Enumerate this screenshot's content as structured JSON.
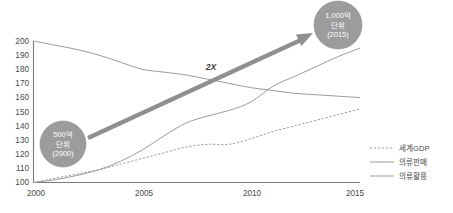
{
  "chart_data": {
    "type": "line",
    "title": "",
    "subtitle": "",
    "xlabel": "",
    "ylabel": "",
    "xlim": [
      2000,
      2015
    ],
    "ylim": [
      100,
      200
    ],
    "grid": false,
    "legend_position": "right",
    "x_ticks": [
      "2000",
      "2005",
      "2010",
      "2015"
    ],
    "y_ticks": [
      "200",
      "190",
      "180",
      "170",
      "160",
      "150",
      "140",
      "130",
      "120",
      "110",
      "100"
    ],
    "x": [
      2000,
      2001,
      2002,
      2003,
      2004,
      2005,
      2006,
      2007,
      2008,
      2009,
      2010,
      2011,
      2012,
      2013,
      2014,
      2015
    ],
    "series": [
      {
        "name": "세계GDP",
        "style": "dashed",
        "color": "#9b9b9b",
        "values": [
          100,
          103,
          106,
          109,
          113,
          117,
          121,
          125,
          127,
          127,
          131,
          136,
          140,
          144,
          148,
          152
        ]
      },
      {
        "name": "의류판매",
        "style": "solid",
        "color": "#9b9b9b",
        "values": [
          100,
          102,
          105,
          109,
          115,
          123,
          133,
          142,
          147,
          151,
          157,
          168,
          175,
          182,
          189,
          195
        ]
      },
      {
        "name": "의류활용",
        "style": "solid",
        "color": "#9b9b9b",
        "values": [
          200,
          197,
          194,
          190,
          185,
          180,
          178,
          176,
          173,
          170,
          167,
          165,
          163,
          162,
          161,
          160
        ]
      }
    ],
    "annotations": [
      {
        "id": "start-bubble",
        "label_lines": [
          "500억",
          "단위",
          "(2000)"
        ],
        "x": 2002.0,
        "y": 128,
        "shape": "circle",
        "color": "#9c9c9c"
      },
      {
        "id": "end-bubble",
        "label_lines": [
          "1,000억",
          "단위",
          "(2015)"
        ],
        "x": 2014.2,
        "y": 212,
        "shape": "circle",
        "color": "#9c9c9c"
      },
      {
        "id": "growth-arrow-label",
        "label": "2X",
        "x": 2008.1,
        "y": 177,
        "shape": "arrow-label",
        "color": "#8f8f8f"
      }
    ]
  },
  "legend": {
    "items": [
      {
        "label": "세계GDP",
        "style": "dashed"
      },
      {
        "label": "의류판매",
        "style": "solid"
      },
      {
        "label": "의류활용",
        "style": "solid"
      }
    ]
  }
}
